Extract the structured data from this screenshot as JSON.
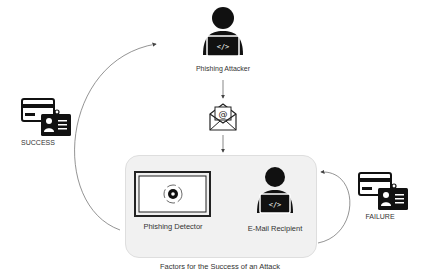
{
  "diagram": {
    "title": "Factors for the Success of an Attack",
    "nodes": {
      "attacker": {
        "label": "Phishing Attacker",
        "icon": "hacker-laptop-icon"
      },
      "email": {
        "label": "",
        "icon": "open-envelope-at-icon"
      },
      "detector": {
        "label": "Phishing Detector",
        "icon": "monitor-gear-icon"
      },
      "recipient": {
        "label": "E-Mail Recipient",
        "icon": "user-laptop-icon"
      },
      "success": {
        "label": "SUCCESS",
        "icon": "credit-card-id-badge-icon"
      },
      "failure": {
        "label": "FAILURE",
        "icon": "credit-card-id-badge-icon"
      }
    },
    "edges": [
      {
        "from": "attacker",
        "to": "email"
      },
      {
        "from": "email",
        "to": "recipient-group"
      },
      {
        "from": "recipient",
        "to": "detector"
      },
      {
        "from": "detector",
        "to": "recipient"
      },
      {
        "from": "recipient-group",
        "to": "success",
        "to_attacker": true
      },
      {
        "from": "recipient-group",
        "to": "failure"
      }
    ],
    "colors": {
      "icon": "#111111",
      "box_fill": "#f1f1f1",
      "line": "#555555"
    }
  }
}
